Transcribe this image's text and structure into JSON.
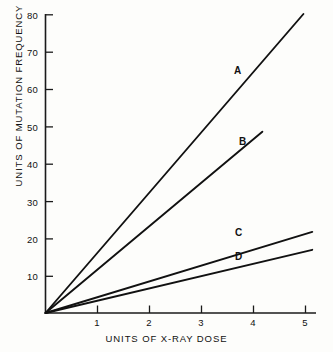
{
  "chart_data": {
    "type": "line",
    "title": "",
    "xlabel": "UNITS OF X-RAY DOSE",
    "ylabel": "UNITS OF MUTATION FREQUENCY",
    "xlim": [
      0,
      5.2
    ],
    "ylim": [
      0,
      80
    ],
    "grid": false,
    "legend_position": "inline-end-of-line",
    "xticks": [
      1,
      2,
      3,
      4,
      5
    ],
    "xtick_labels": [
      "1",
      "2",
      "3",
      "4",
      "5"
    ],
    "yticks": [
      10,
      20,
      30,
      40,
      50,
      60,
      70,
      80
    ],
    "ytick_labels": [
      "10",
      "20",
      "30",
      "40",
      "50",
      "60",
      "70",
      "80"
    ],
    "series": [
      {
        "name": "A",
        "label": "A",
        "slope": 16.1,
        "x": [
          0,
          4.96
        ],
        "values": [
          0,
          80
        ],
        "label_x": 4.0,
        "label_y": 63
      },
      {
        "name": "B",
        "label": "B",
        "slope": 11.6,
        "x": [
          0,
          4.17
        ],
        "values": [
          0,
          48.5
        ],
        "label_x": 3.65,
        "label_y": 46
      },
      {
        "name": "C",
        "label": "C",
        "slope": 4.23,
        "x": [
          0,
          5.13
        ],
        "values": [
          0,
          21.7
        ],
        "label_x": 4.02,
        "label_y": 22.5
      },
      {
        "name": "D",
        "label": "D",
        "slope": 3.29,
        "x": [
          0,
          5.13
        ],
        "values": [
          0,
          16.9
        ],
        "label_x": 4.02,
        "label_y": 17.4
      }
    ],
    "line_color": "#111111",
    "axis_color": "#1a1a1a",
    "background_color": "#fdfdfb"
  },
  "axes": {
    "x_title": "UNITS OF X-RAY DOSE",
    "y_title": "UNITS OF MUTATION FREQUENCY",
    "x_tick_1": "1",
    "x_tick_2": "2",
    "x_tick_3": "3",
    "x_tick_4": "4",
    "x_tick_5": "5",
    "y_tick_10": "10",
    "y_tick_20": "20",
    "y_tick_30": "30",
    "y_tick_40": "40",
    "y_tick_50": "50",
    "y_tick_60": "60",
    "y_tick_70": "70",
    "y_tick_80": "80"
  },
  "series_labels": {
    "a": "A",
    "b": "B",
    "c": "C",
    "d": "D"
  }
}
